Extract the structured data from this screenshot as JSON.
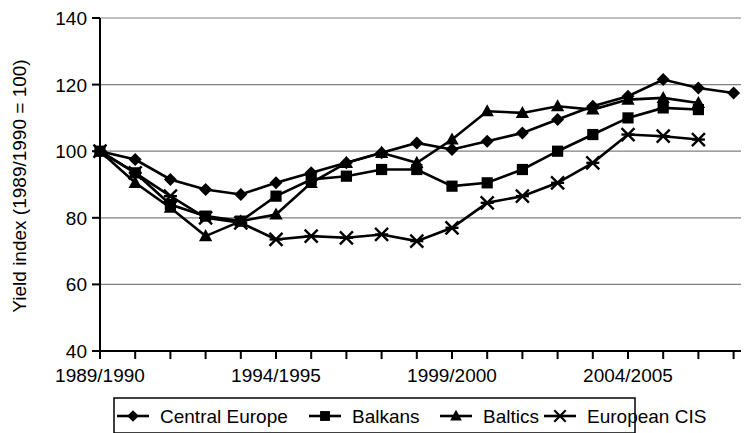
{
  "chart_data": {
    "type": "line",
    "title": "",
    "xlabel": "",
    "ylabel": "Yield index (1989/1990 = 100)",
    "ylim": [
      40,
      140
    ],
    "ytick_labels": [
      "140",
      "120",
      "100",
      "80",
      "60",
      "40"
    ],
    "ytick_values": [
      140,
      120,
      100,
      80,
      60,
      40
    ],
    "grid": true,
    "grid_axis": "y",
    "legend_position": "bottom",
    "x": [
      "1989/1990",
      "1990/1991",
      "1991/1992",
      "1992/1993",
      "1993/1994",
      "1994/1995",
      "1995/1996",
      "1996/1997",
      "1997/1998",
      "1998/1999",
      "1999/2000",
      "2000/2001",
      "2001/2002",
      "2002/2003",
      "2003/2004",
      "2004/2005",
      "2005/2006",
      "2006/2007",
      "2007/2008"
    ],
    "xtick_labels": [
      "1989/1990",
      "1994/1995",
      "1999/2000",
      "2004/2005"
    ],
    "xtick_label_indices": [
      0,
      5,
      10,
      15
    ],
    "series": [
      {
        "name": "Central Europe",
        "marker": "diamond",
        "color": "#000000",
        "values": [
          100,
          97.5,
          91.5,
          88.5,
          87,
          90.5,
          93.5,
          96.5,
          99.5,
          102.5,
          100.5,
          103,
          105.5,
          109.5,
          113.5,
          116.5,
          121.5,
          119,
          117.5
        ]
      },
      {
        "name": "Balkans",
        "marker": "square",
        "color": "#000000",
        "values": [
          100,
          93.5,
          84,
          80.5,
          79,
          86.5,
          91.5,
          92.5,
          94.5,
          94.5,
          89.5,
          90.5,
          94.5,
          100,
          105,
          110,
          113,
          112.5,
          null
        ]
      },
      {
        "name": "Baltics",
        "marker": "triangle",
        "color": "#000000",
        "values": [
          100,
          90.5,
          83,
          74.5,
          79,
          81,
          90.5,
          96.5,
          99.5,
          96.5,
          103.5,
          112,
          111.5,
          113.5,
          112.5,
          115.5,
          116,
          114.5,
          null
        ]
      },
      {
        "name": "European CIS",
        "marker": "cross",
        "color": "#000000",
        "values": [
          100,
          93.5,
          86.5,
          80,
          78.5,
          73.5,
          74.5,
          74,
          75,
          73,
          77,
          84.5,
          86.5,
          90.5,
          96.5,
          105,
          104.5,
          103.5,
          null
        ]
      }
    ]
  },
  "legend": {
    "items": [
      {
        "label": "Central Europe",
        "marker": "diamond"
      },
      {
        "label": "Balkans",
        "marker": "square"
      },
      {
        "label": "Baltics",
        "marker": "triangle"
      },
      {
        "label": "European CIS",
        "marker": "cross"
      }
    ]
  }
}
